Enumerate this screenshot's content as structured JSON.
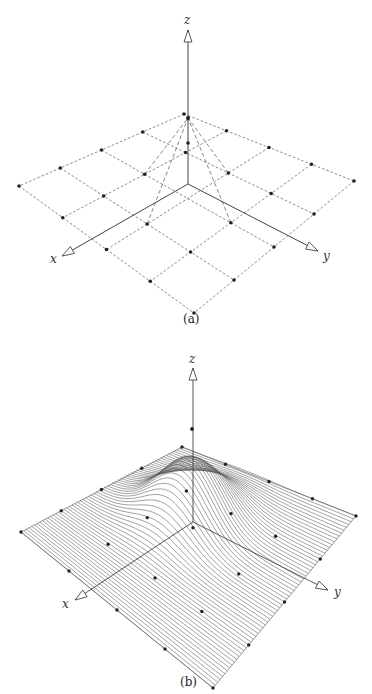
{
  "figures": [
    {
      "id": "a",
      "caption": "(a)",
      "description": "Control net (dashed grid) of a 5x5 bicubic patch with the central vertex raised",
      "axes": {
        "x_label": "x",
        "y_label": "y",
        "z_label": "z"
      },
      "grid": {
        "rows": 5,
        "cols": 5,
        "raised_point": "center",
        "line_style": "dashed"
      }
    },
    {
      "id": "b",
      "caption": "(b)",
      "description": "Resulting surface drawn as isoparametric curves with a bump near the raised control point",
      "axes": {
        "x_label": "x",
        "y_label": "y",
        "z_label": "z"
      },
      "curves": 60
    }
  ],
  "colors": {
    "line": "#555555",
    "dot": "#222222",
    "axis": "#444444"
  }
}
